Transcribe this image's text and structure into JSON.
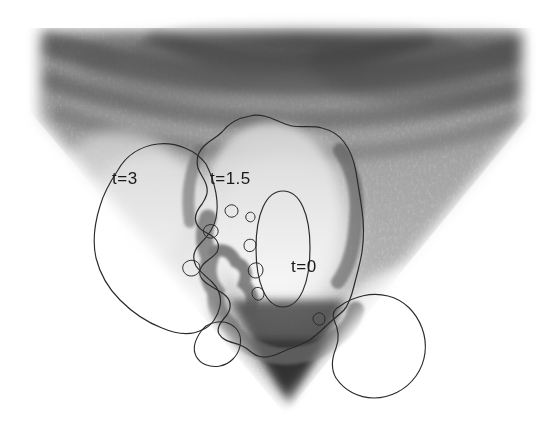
{
  "figure": {
    "type": "medical-ultrasound-with-level-set-contours",
    "modality": "ultrasound B-mode sector scan",
    "background_color": "#ffffff",
    "speckle_color_dark": "#2b2b2b",
    "speckle_color_mid": "#9a9a9a",
    "speckle_color_light": "#f2f2f2",
    "contour_color": "#2a2a2a",
    "contour_stroke_width": 1.1,
    "sector": {
      "apex_x": 285,
      "apex_y": 414,
      "top_y": 28,
      "left_x": 28,
      "right_x": 531
    }
  },
  "contours": [
    {
      "id": "contour-t3",
      "label": "t=3",
      "label_x": 112,
      "label_y": 184,
      "description": "large outer level-set contour on left side"
    },
    {
      "id": "contour-t15",
      "label": "t=1.5",
      "label_x": 210,
      "label_y": 184,
      "description": "intermediate level-set contour outlining bright lesion region"
    },
    {
      "id": "contour-t0",
      "label": "t=0",
      "label_x": 291,
      "label_y": 272,
      "description": "initial elliptical seed contour at centre"
    }
  ],
  "annotations": {
    "t3_text": "t=3",
    "t15_text": "t=1.5",
    "t0_text": "t=0"
  }
}
